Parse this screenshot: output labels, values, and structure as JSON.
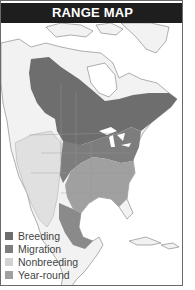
{
  "header": {
    "title": "RANGE MAP"
  },
  "legend": {
    "items": [
      {
        "label": "Breeding",
        "color": "#6e6e6e"
      },
      {
        "label": "Migration",
        "color": "#7d7d7d"
      },
      {
        "label": "Nonbreeding",
        "color": "#d2d2d2"
      },
      {
        "label": "Year-round",
        "color": "#a0a0a0"
      }
    ]
  },
  "colors": {
    "header_bg": "#1e1e1e",
    "land": "#f2f2f2",
    "water": "#ffffff",
    "border": "#888888"
  }
}
